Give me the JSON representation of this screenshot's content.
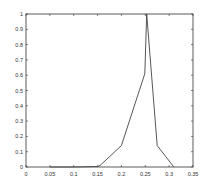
{
  "chart_data": {
    "type": "line",
    "title": "",
    "xlabel": "",
    "ylabel": "",
    "xlim": [
      0,
      0.35
    ],
    "ylim": [
      0,
      1
    ],
    "grid": false,
    "legend": null,
    "x_ticks": [
      "0",
      "0.05",
      "0.1",
      "0.15",
      "0.2",
      "0.25",
      "0.3",
      "0.35"
    ],
    "y_ticks": [
      "0",
      "0.1",
      "0.2",
      "0.3",
      "0.4",
      "0.5",
      "0.6",
      "0.7",
      "0.8",
      "0.9",
      "1"
    ],
    "series": [
      {
        "name": "series-1",
        "color": "#333333",
        "x": [
          0.05,
          0.1,
          0.15,
          0.155,
          0.2,
          0.249,
          0.253,
          0.275,
          0.31
        ],
        "y": [
          0.0,
          0.0,
          0.003,
          0.01,
          0.14,
          0.61,
          1.0,
          0.14,
          0.0
        ]
      }
    ]
  },
  "style": {
    "axis_color": "#333333",
    "line_color": "#444444",
    "background": "#ffffff"
  }
}
